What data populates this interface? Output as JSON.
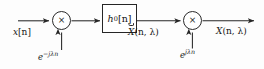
{
  "diagram": {
    "kind": "signal-flow-block-diagram",
    "stroke_color": "#262626",
    "background_color": "#fdfdfd",
    "input": {
      "label_base": "x",
      "label_index": "[n]",
      "label_full": "x[n]"
    },
    "multiplier_1": {
      "symbol": "×",
      "name": "modulator-down"
    },
    "modulation_down": {
      "base": "e",
      "exponent": "−jλn",
      "label_full": "e^{-jλn}"
    },
    "filter": {
      "base": "h",
      "subscript": "0",
      "index": "[n]",
      "label_full": "h₀[n]"
    },
    "intermediate": {
      "base": "X",
      "accent": "breve",
      "args": "(n, λ)",
      "label_full": "X̆(n, λ)"
    },
    "multiplier_2": {
      "symbol": "×",
      "name": "modulator-up"
    },
    "modulation_up": {
      "base": "e",
      "exponent": "jλn",
      "label_full": "e^{jλn}"
    },
    "output": {
      "base": "X",
      "args": "(n, λ)",
      "label_full": "X(n, λ)"
    }
  }
}
